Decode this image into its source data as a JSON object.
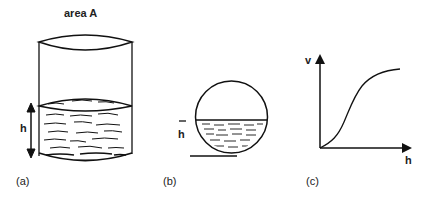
{
  "figure": {
    "panels": [
      {
        "id": "a",
        "caption": "(a)",
        "title": "area  A",
        "height_label": "h",
        "description": "Cylindrical tank partially filled with liquid; double-headed arrow indicates liquid height h"
      },
      {
        "id": "b",
        "caption": "(b)",
        "height_label": "h",
        "description": "Spherical tank partially filled with liquid; liquid height h marked from base line"
      },
      {
        "id": "c",
        "caption": "(c)",
        "y_axis_label": "v",
        "x_axis_label": "h",
        "description": "Volume v versus height h for spherical tank: S-shaped curve"
      }
    ],
    "colors": {
      "ink": "#111111",
      "background": "#ffffff"
    }
  }
}
